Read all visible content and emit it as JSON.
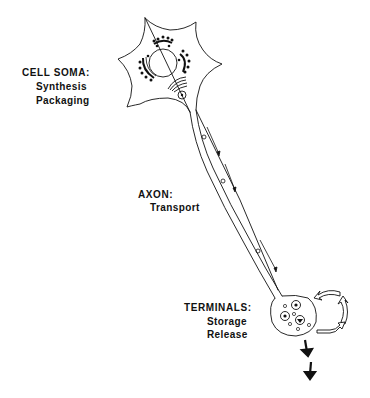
{
  "diagram": {
    "type": "neuron-schematic",
    "labels": {
      "soma": {
        "title": "CELL SOMA:",
        "lines": [
          "Synthesis",
          "Packaging"
        ]
      },
      "axon": {
        "title": "AXON:",
        "lines": [
          "Transport"
        ]
      },
      "terminals": {
        "title": "TERMINALS:",
        "lines": [
          "Storage",
          "Release"
        ]
      }
    },
    "parts": [
      "cell-soma",
      "nucleus",
      "rough-er",
      "golgi-apparatus",
      "vesicle",
      "axon",
      "axonal-transport-arrows",
      "axon-terminal",
      "synaptic-vesicles",
      "recycling-arrows",
      "release-arrows"
    ],
    "colors": {
      "ink": "#111111",
      "background": "#ffffff"
    }
  }
}
